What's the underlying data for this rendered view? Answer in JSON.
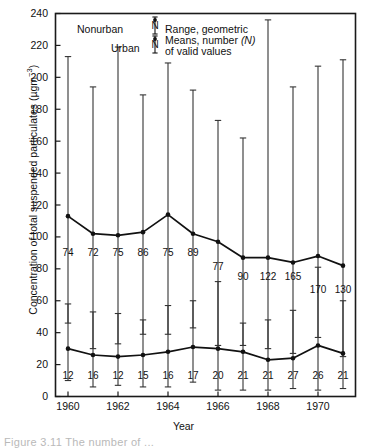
{
  "figure": {
    "caption_partial": "Figure 3.11  The number of ..."
  },
  "chart_data": {
    "type": "line",
    "title": "",
    "xlabel": "Year",
    "ylabel": "Concentration of total suspended particulates (µgm⁻³)",
    "ylabel_main": "Concentration of total suspended particulates (µgm",
    "ylabel_sup": "−3",
    "ylabel_tail": ")",
    "xlim": [
      1959.5,
      1971.5
    ],
    "ylim": [
      0,
      240
    ],
    "grid": false,
    "y_ticks": [
      0,
      20,
      40,
      60,
      80,
      100,
      120,
      140,
      160,
      180,
      200,
      220,
      240
    ],
    "y_tick_labels": [
      "0",
      "20",
      "40",
      "60",
      "80",
      "100",
      "120",
      "140",
      "160",
      "180",
      "200",
      "220",
      "240"
    ],
    "x": [
      1960,
      1961,
      1962,
      1963,
      1964,
      1965,
      1966,
      1967,
      1968,
      1969,
      1970,
      1971
    ],
    "x_ticks": [
      1960,
      1962,
      1964,
      1966,
      1968,
      1970
    ],
    "x_tick_labels": [
      "1960",
      "1962",
      "1964",
      "1966",
      "1968",
      "1970"
    ],
    "series": [
      {
        "name": "Urban",
        "values": [
          113,
          102,
          101,
          103,
          114,
          102,
          97,
          87,
          87,
          84,
          88,
          82
        ],
        "range_low": [
          46,
          30,
          33,
          39,
          39,
          43,
          32,
          32,
          30,
          27,
          37,
          25
        ],
        "range_high": [
          213,
          194,
          219,
          189,
          209,
          192,
          173,
          162,
          236,
          194,
          207,
          211
        ],
        "n_values": [
          74,
          72,
          75,
          86,
          75,
          89,
          77,
          90,
          122,
          165,
          170,
          130
        ]
      },
      {
        "name": "Nonurban",
        "values": [
          30,
          26,
          25,
          26,
          28,
          31,
          30,
          28,
          23,
          24,
          32,
          27
        ],
        "range_low": [
          10,
          6,
          7,
          6,
          6,
          9,
          4,
          4,
          4,
          5,
          4,
          5
        ],
        "range_high": [
          58,
          53,
          52,
          48,
          57,
          60,
          72,
          46,
          48,
          54,
          81,
          60
        ],
        "n_values": [
          12,
          16,
          12,
          15,
          16,
          17,
          20,
          21,
          21,
          27,
          26,
          21
        ]
      }
    ],
    "legend": {
      "position": "top-center-inside",
      "entries": [
        {
          "label": "Nonurban",
          "symbol": "N-errorbar"
        },
        {
          "label": "Urban",
          "symbol": "N-errorbar"
        }
      ],
      "description_lines": [
        "Range, geometric",
        "Means, number (N)",
        "of valid values"
      ],
      "description_line1": "Range, geometric",
      "description_line2_pre": "Means, number ",
      "description_line2_em": "(N)",
      "description_line3": "of valid values",
      "symbol_letter": "N"
    },
    "colors": {
      "axis": "#1a1a1a",
      "urban_line": "#111111",
      "nonurban_line": "#111111",
      "errorbar": "#333333",
      "background": "#ffffff"
    }
  }
}
